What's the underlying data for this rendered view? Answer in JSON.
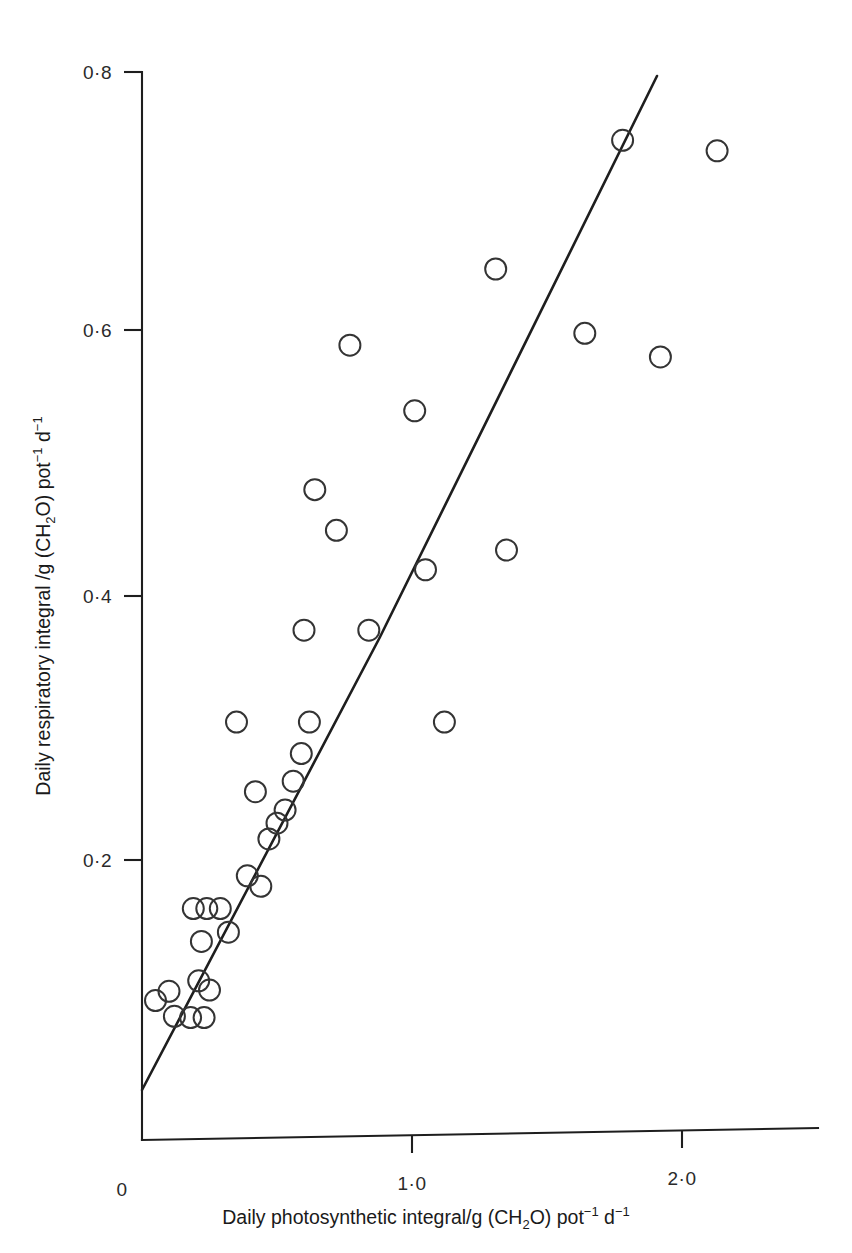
{
  "figure": {
    "background": "#ffffff",
    "ink_color": "#1e1e1e",
    "marker_color": "#343434"
  },
  "axes": {
    "x_title_parts": {
      "main": "Daily photosynthetic integral/g (CH",
      "sub1": "2",
      "mid": "O) pot",
      "sup1": "−1",
      "tail": " d",
      "sup2": "−1"
    },
    "y_title_parts": {
      "main": "Daily respiratory integral /g (CH",
      "sub1": "2",
      "mid": "O) pot",
      "sup1": "−1",
      "tail": " d",
      "sup2": "−1"
    },
    "x_tick_labels": [
      "0",
      "1·0",
      "2·0"
    ],
    "y_tick_labels": [
      "0·2",
      "0·4",
      "0·6",
      "0·8"
    ]
  },
  "chart_data": {
    "type": "scatter",
    "title": "",
    "xlabel": "Daily photosynthetic integral/g (CH2O) pot-1 d-1",
    "ylabel": "Daily respiratory integral /g (CH2O) pot-1 d-1",
    "xlim": [
      0,
      2.5
    ],
    "ylim": [
      0,
      0.8
    ],
    "xticks": [
      0,
      1.0,
      2.0
    ],
    "yticks": [
      0.2,
      0.4,
      0.6,
      0.8
    ],
    "xtick_labels": [
      "0",
      "1·0",
      "2·0"
    ],
    "ytick_labels": [
      "0·2",
      "0·4",
      "0·6",
      "0·8"
    ],
    "grid": false,
    "legend": null,
    "marker_style": "open-circle",
    "points": [
      {
        "x": 0.05,
        "y": 0.093
      },
      {
        "x": 0.1,
        "y": 0.1
      },
      {
        "x": 0.12,
        "y": 0.081
      },
      {
        "x": 0.18,
        "y": 0.08
      },
      {
        "x": 0.23,
        "y": 0.08
      },
      {
        "x": 0.21,
        "y": 0.108
      },
      {
        "x": 0.25,
        "y": 0.101
      },
      {
        "x": 0.22,
        "y": 0.138
      },
      {
        "x": 0.19,
        "y": 0.163
      },
      {
        "x": 0.24,
        "y": 0.163
      },
      {
        "x": 0.29,
        "y": 0.163
      },
      {
        "x": 0.32,
        "y": 0.145
      },
      {
        "x": 0.35,
        "y": 0.305
      },
      {
        "x": 0.39,
        "y": 0.188
      },
      {
        "x": 0.44,
        "y": 0.18
      },
      {
        "x": 0.42,
        "y": 0.252
      },
      {
        "x": 0.47,
        "y": 0.216
      },
      {
        "x": 0.5,
        "y": 0.228
      },
      {
        "x": 0.53,
        "y": 0.238
      },
      {
        "x": 0.56,
        "y": 0.26
      },
      {
        "x": 0.59,
        "y": 0.281
      },
      {
        "x": 0.62,
        "y": 0.305
      },
      {
        "x": 0.6,
        "y": 0.375
      },
      {
        "x": 0.64,
        "y": 0.482
      },
      {
        "x": 0.72,
        "y": 0.451
      },
      {
        "x": 0.77,
        "y": 0.592
      },
      {
        "x": 0.84,
        "y": 0.375
      },
      {
        "x": 1.01,
        "y": 0.542
      },
      {
        "x": 1.05,
        "y": 0.421
      },
      {
        "x": 1.12,
        "y": 0.305
      },
      {
        "x": 1.31,
        "y": 0.65
      },
      {
        "x": 1.35,
        "y": 0.436
      },
      {
        "x": 1.64,
        "y": 0.601
      },
      {
        "x": 1.78,
        "y": 0.748
      },
      {
        "x": 1.92,
        "y": 0.583
      },
      {
        "x": 2.13,
        "y": 0.74
      }
    ],
    "fit_line": {
      "type": "two-segment",
      "segments": [
        {
          "x0": 0.0,
          "y0": 0.038,
          "x1": 0.88,
          "y1": 0.381
        },
        {
          "x0": 0.88,
          "y1": 0.787,
          "x1": 1.91,
          "y0": 0.381
        }
      ],
      "description": "Straight fitted line rising from lower-left near origin through the data to the upper right"
    }
  }
}
